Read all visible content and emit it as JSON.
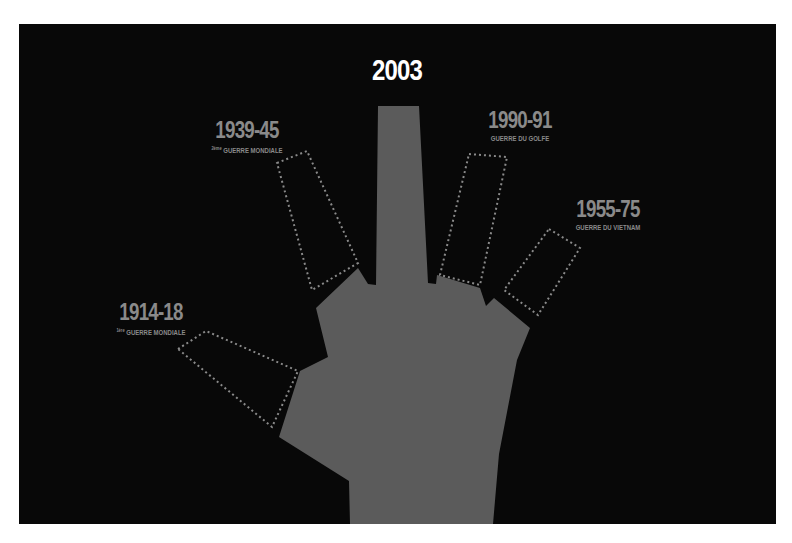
{
  "colors": {
    "background": "#080808",
    "page": "#ffffff",
    "hand": "#5b5b5b",
    "dotted_outline": "#8a8a8a",
    "label": "#8a8a8a",
    "highlight_label": "#ffffff"
  },
  "highlight": {
    "year": "2003"
  },
  "fingers": [
    {
      "id": "thumb",
      "year": "1914-18",
      "ordinal": "1ère",
      "caption": "GUERRE MONDIALE"
    },
    {
      "id": "index",
      "year": "1939-45",
      "ordinal": "2ème",
      "caption": "GUERRE MONDIALE"
    },
    {
      "id": "ring",
      "year": "1990-91",
      "ordinal": "",
      "caption": "GUERRE DU GOLFE"
    },
    {
      "id": "pinky",
      "year": "1955-75",
      "ordinal": "",
      "caption": "GUERRE DU VIETNAM"
    }
  ]
}
